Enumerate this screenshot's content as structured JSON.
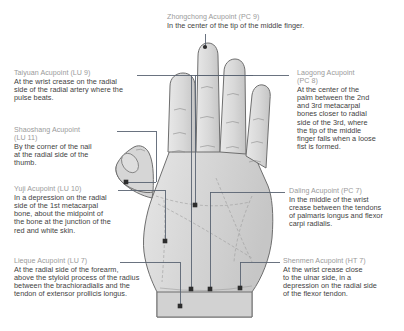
{
  "figure": {
    "colors": {
      "heading_text": "#9a9a9a",
      "body_text": "#3f3f3f",
      "leader_line": "#5a6472",
      "marker": "#2d2d2d",
      "hand_fill": "#d9d9d9",
      "hand_outline": "#6e6e6e",
      "background": "#ffffff"
    },
    "hand_label": "left palm illustration"
  },
  "callouts": [
    {
      "id": "zhongchong",
      "heading": "Zhongchong Acupoint (PC 9)",
      "lines": [
        "In the center of the tip of the middle finger."
      ],
      "point": {
        "x": 205,
        "y": 47
      }
    },
    {
      "id": "taiyuan",
      "heading": "Taiyuan Acupoint (LU 9)",
      "lines": [
        "At the wrist crease on the radial",
        "side of the radial artery where the",
        "pulse beats."
      ],
      "point": {
        "x": 191,
        "y": 289
      }
    },
    {
      "id": "shaoshang",
      "heading": "Shaoshang Acupoint",
      "heading2": "(LU 11)",
      "lines": [
        "By the corner of the nail",
        "at the radial side of the",
        "thumb."
      ],
      "point": {
        "x": 126,
        "y": 182
      }
    },
    {
      "id": "yuji",
      "heading": "Yuji Acupoint (LU 10)",
      "lines": [
        "In a depression on the radial",
        "side of the 1st metacarpal",
        "bone, about the midpoint of",
        "the bone at the junction of the",
        "red and white skin."
      ],
      "point": {
        "x": 165,
        "y": 241
      }
    },
    {
      "id": "lieque",
      "heading": "Lieque Acupoint (LU 7)",
      "lines": [
        "At the radial side of the forearm,",
        "above the styloid process of the radius",
        "between the brachioradialis and the",
        "tendon of extensor prollicis longus."
      ],
      "point": {
        "x": 180,
        "y": 306
      }
    },
    {
      "id": "laogong",
      "heading": "Laogong Acupoint",
      "heading2": "(PC 8)",
      "lines": [
        "At the center of the",
        "palm between the 2nd",
        "and 3rd metacarpal",
        "bones closer to radial",
        "side of the 3rd, where",
        "the tip of the middle",
        "finger falls when a loose",
        "fist is formed."
      ],
      "point": {
        "x": 195,
        "y": 205
      }
    },
    {
      "id": "daling",
      "heading": "Daling Acupoint (PC 7)",
      "lines": [
        "In the middle of the wrist",
        "crease between the tendons",
        "of palmaris longus and flexor",
        "carpi radialis."
      ],
      "point": {
        "x": 210,
        "y": 289
      }
    },
    {
      "id": "shenmen",
      "heading": "Shenmen Acupoint (HT 7)",
      "lines": [
        "At the wrist crease close",
        "to the ulnar side, in a",
        "depression on the radial side",
        "of the flexor tendon."
      ],
      "point": {
        "x": 240,
        "y": 288
      }
    }
  ]
}
